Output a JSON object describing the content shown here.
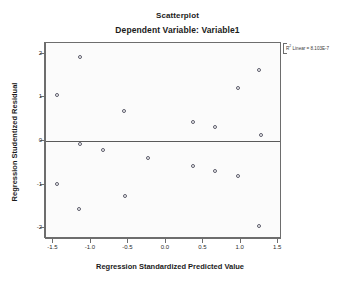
{
  "chart_data": {
    "type": "scatter",
    "title": "Scatterplot",
    "subtitle": "Dependent Variable: Variable1",
    "xlabel": "Regression Standardized Predicted Value",
    "ylabel": "Regression Studentized Residual",
    "xlim": [
      -1.6,
      1.55
    ],
    "ylim": [
      -2.25,
      2.25
    ],
    "xticks": [
      -1.5,
      -1.0,
      -0.5,
      0.0,
      0.5,
      1.0,
      1.5
    ],
    "xticklabels": [
      "-1.5",
      "-1.0",
      "-0.5",
      "0.0",
      "0.5",
      "1.0",
      "1.5"
    ],
    "yticks": [
      2,
      1,
      0,
      -1,
      -2
    ],
    "yticklabels": [
      "2",
      "1",
      "0",
      "-1",
      "-2"
    ],
    "grid": false,
    "legend": null,
    "zero_reference_line": 0,
    "annotation": {
      "superscript_base": "R",
      "superscript": "2",
      "text": " Linear = 8.103E-7"
    },
    "marker": "open-circle",
    "points": [
      {
        "x": -1.15,
        "y": 1.93
      },
      {
        "x": -1.45,
        "y": 1.06
      },
      {
        "x": -0.56,
        "y": 0.7
      },
      {
        "x": 1.24,
        "y": 1.64
      },
      {
        "x": 0.96,
        "y": 1.21
      },
      {
        "x": 0.36,
        "y": 0.43
      },
      {
        "x": 0.65,
        "y": 0.31
      },
      {
        "x": 1.27,
        "y": 0.13
      },
      {
        "x": -1.15,
        "y": -0.07
      },
      {
        "x": -0.84,
        "y": -0.2
      },
      {
        "x": -0.24,
        "y": -0.38
      },
      {
        "x": 0.36,
        "y": -0.58
      },
      {
        "x": 0.65,
        "y": -0.7
      },
      {
        "x": 0.96,
        "y": -0.81
      },
      {
        "x": -1.45,
        "y": -0.99
      },
      {
        "x": -0.55,
        "y": -1.26
      },
      {
        "x": -1.16,
        "y": -1.57
      },
      {
        "x": 1.24,
        "y": -1.95
      }
    ]
  }
}
